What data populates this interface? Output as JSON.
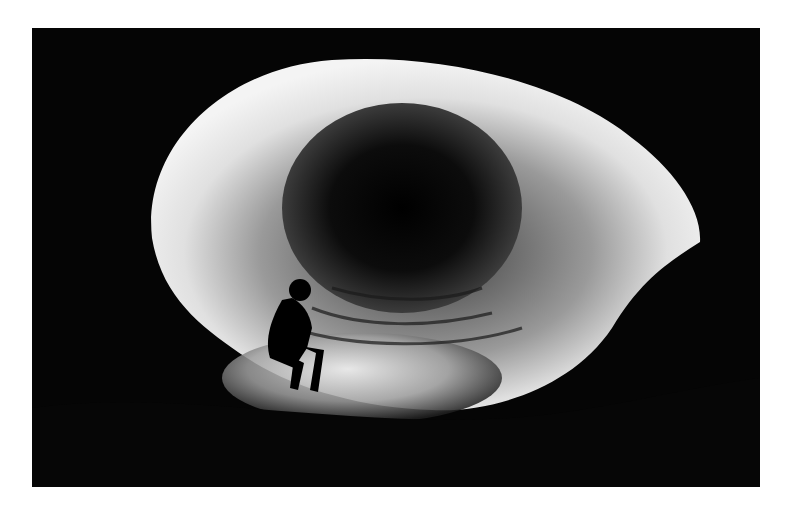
{
  "image": {
    "subject": "cave-tunnel-with-explorer",
    "style": "black-and-white photograph",
    "colors": {
      "background": "#ffffff",
      "photo_dark": "#050505",
      "rock_light": "#e8e8e8",
      "tunnel_dark": "#0a0a0a"
    }
  }
}
